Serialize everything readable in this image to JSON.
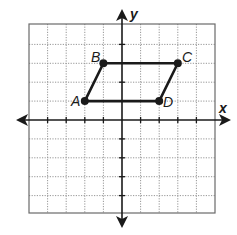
{
  "chart_data": {
    "type": "scatter",
    "title": "",
    "xlabel": "x",
    "ylabel": "y",
    "xlim": [
      -5,
      5
    ],
    "ylim": [
      -5,
      5
    ],
    "grid": true,
    "grid_style": "dotted",
    "shape": "parallelogram",
    "points": [
      {
        "label": "A",
        "x": -2,
        "y": 1
      },
      {
        "label": "B",
        "x": -1,
        "y": 3
      },
      {
        "label": "C",
        "x": 3,
        "y": 3
      },
      {
        "label": "D",
        "x": 2,
        "y": 1
      }
    ],
    "polygon_order": [
      "A",
      "B",
      "C",
      "D"
    ]
  },
  "labels": {
    "x_axis": "x",
    "y_axis": "y",
    "A": "A",
    "B": "B",
    "C": "C",
    "D": "D"
  },
  "colors": {
    "ink": "#1a1a1a",
    "grid": "#8a8a8a",
    "background": "#ffffff"
  }
}
